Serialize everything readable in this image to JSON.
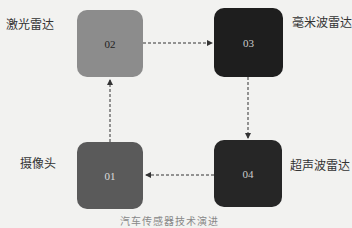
{
  "nodes": [
    {
      "id": "01",
      "label": "摄像头",
      "color": "#5a5a5a",
      "text_color": "#dddddd"
    },
    {
      "id": "02",
      "label": "激光雷达",
      "color": "#8c8c8c",
      "text_color": "#222222"
    },
    {
      "id": "03",
      "label": "毫米波雷达",
      "color": "#1e1e1e",
      "text_color": "#cccccc"
    },
    {
      "id": "04",
      "label": "超声波雷达",
      "color": "#262626",
      "text_color": "#cccccc"
    }
  ],
  "edges": [
    {
      "from": "01",
      "to": "02",
      "style": "dashed"
    },
    {
      "from": "02",
      "to": "03",
      "style": "dashed"
    },
    {
      "from": "03",
      "to": "04",
      "style": "dashed"
    },
    {
      "from": "04",
      "to": "01",
      "style": "dashed"
    }
  ],
  "caption": "汽车传感器技术演进"
}
